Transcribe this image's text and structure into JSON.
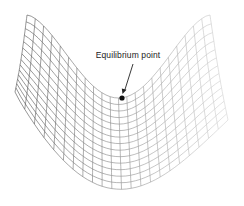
{
  "diagram": {
    "type": "saddle-surface-mesh",
    "annotation": {
      "label": "Equilibrium point",
      "marker": "filled-dot",
      "point": [
        122,
        98
      ]
    },
    "colors": {
      "mesh_dark": "#555555",
      "mesh_light": "#cccccc",
      "marker": "#111111",
      "text": "#222222"
    },
    "mesh": {
      "rows": 14,
      "cols": 22
    }
  }
}
